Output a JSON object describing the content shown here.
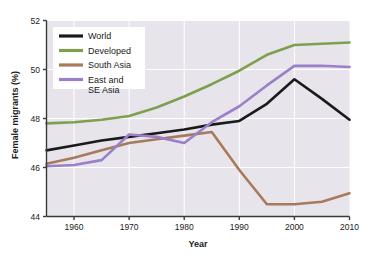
{
  "chart_data": {
    "type": "line",
    "title": "",
    "xlabel": "Year",
    "ylabel": "Female migrants (%)",
    "xlim": [
      1955,
      2010
    ],
    "ylim": [
      44,
      52
    ],
    "xticks": [
      1960,
      1970,
      1980,
      1990,
      2000,
      2010
    ],
    "yticks": [
      44,
      46,
      48,
      50,
      52
    ],
    "grid": true,
    "legend_position": "upper-left",
    "x": [
      1955,
      1960,
      1965,
      1970,
      1975,
      1980,
      1985,
      1990,
      1995,
      2000,
      2005,
      2010
    ],
    "series": [
      {
        "name": "World",
        "color": "#1a1a1a",
        "values": [
          46.7,
          46.9,
          47.1,
          47.25,
          47.4,
          47.55,
          47.75,
          47.9,
          48.6,
          49.6,
          48.8,
          47.95
        ]
      },
      {
        "name": "Developed",
        "color": "#7e9f4e",
        "values": [
          47.8,
          47.85,
          47.95,
          48.1,
          48.45,
          48.9,
          49.4,
          49.95,
          50.6,
          51.0,
          51.05,
          51.1
        ]
      },
      {
        "name": "South Asia",
        "color": "#a8795c",
        "values": [
          46.15,
          46.4,
          46.7,
          47.0,
          47.15,
          47.3,
          47.45,
          45.9,
          44.5,
          44.5,
          44.6,
          44.95
        ]
      },
      {
        "name": "East and\nSE Asia",
        "color": "#9b7fc8",
        "values": [
          46.05,
          46.1,
          46.3,
          47.35,
          47.25,
          47.0,
          47.85,
          48.5,
          49.35,
          50.15,
          50.15,
          50.1
        ]
      }
    ]
  },
  "legend": {
    "entries": [
      {
        "label": "World",
        "color": "#1a1a1a"
      },
      {
        "label": "Developed",
        "color": "#7e9f4e"
      },
      {
        "label": "South Asia",
        "color": "#a8795c"
      },
      {
        "label": "East and\nSE Asia",
        "color": "#9b7fc8"
      }
    ]
  },
  "axes": {
    "ylabel": "Female migrants (%)",
    "xlabel": "Year",
    "yticks": [
      "52",
      "50",
      "48",
      "46",
      "44"
    ],
    "xticks": [
      "1960",
      "1970",
      "1980",
      "1990",
      "2000",
      "2010"
    ]
  },
  "colors": {
    "plot_background": "#e7e5eb",
    "gridline": "#ffffff",
    "axis": "#3a3a3a",
    "text": "#1a1a1a",
    "page_background": "#ffffff"
  }
}
